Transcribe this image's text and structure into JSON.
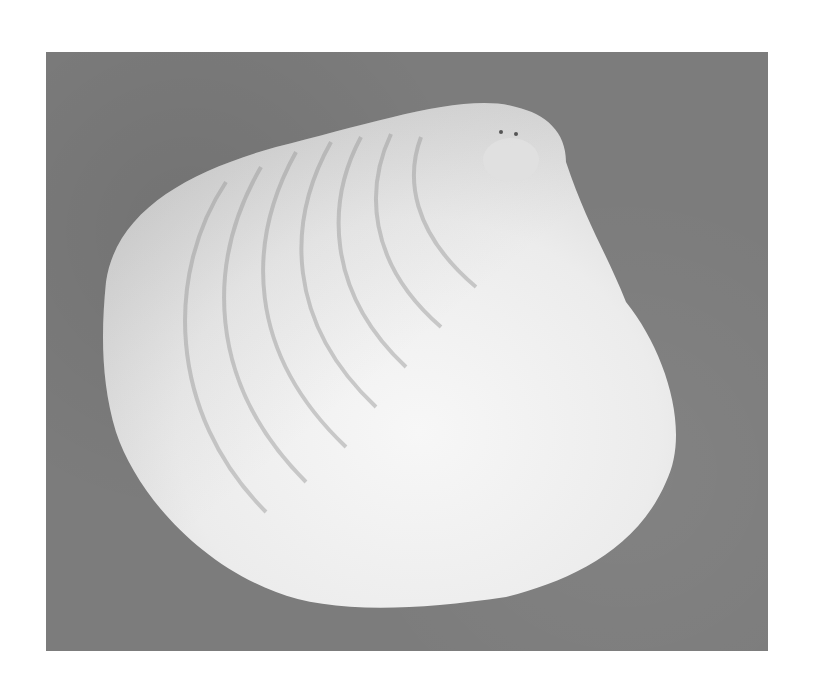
{
  "image": {
    "subject": "clam shell",
    "description": "Grayscale photograph of a single bivalve (clam) shell on a mottled gray background",
    "colors": {
      "page_background": "#ffffff",
      "photo_background": "#7c7c7c",
      "shell_light": "#f4f4f4",
      "shell_mid": "#d8d8d8",
      "growth_rings": "#a8a8a8"
    }
  }
}
